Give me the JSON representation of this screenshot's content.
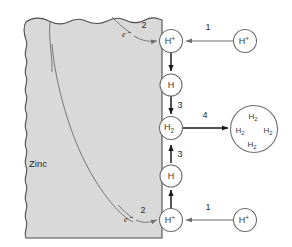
{
  "figure": {
    "background_color": "#ffffff"
  },
  "metal": {
    "label": "Zinc",
    "fill_color": "#d9d9d9",
    "stroke_color": "#4d4d4d"
  },
  "electrons": [
    {
      "label": "e⁻",
      "step": "2"
    },
    {
      "label": "e⁻",
      "step": "2"
    }
  ],
  "nodes": {
    "h_plus_top_surface": {
      "base": "H",
      "charge": "+"
    },
    "h_plus_top_solution": {
      "base": "H",
      "charge": "+"
    },
    "h_atom_top": {
      "base": "H",
      "charge": ""
    },
    "h2_center": {
      "base": "H",
      "subscript": "2"
    },
    "h_atom_bottom": {
      "base": "H",
      "charge": ""
    },
    "h_plus_bottom_surface": {
      "base": "H",
      "charge": "+"
    },
    "h_plus_bottom_solution": {
      "base": "H",
      "charge": "+"
    }
  },
  "bubble": {
    "molecules": [
      {
        "base": "H",
        "subscript": "2"
      },
      {
        "base": "H",
        "subscript": "2"
      },
      {
        "base": "H",
        "subscript": "2"
      },
      {
        "base": "H",
        "subscript": "2"
      }
    ]
  },
  "steps": {
    "adsorption_top": "1",
    "electron_transfer_top": "2",
    "combination_upper": "3",
    "combination_lower": "3",
    "bubble_formation": "4",
    "electron_transfer_bottom": "2",
    "adsorption_bottom": "1"
  },
  "colors": {
    "arrow_dark": "#1a1a1a",
    "arrow_gray": "#6e6e6e",
    "circle_stroke": "#6e6e6e",
    "grain_boundary": "#6b6b6b"
  }
}
